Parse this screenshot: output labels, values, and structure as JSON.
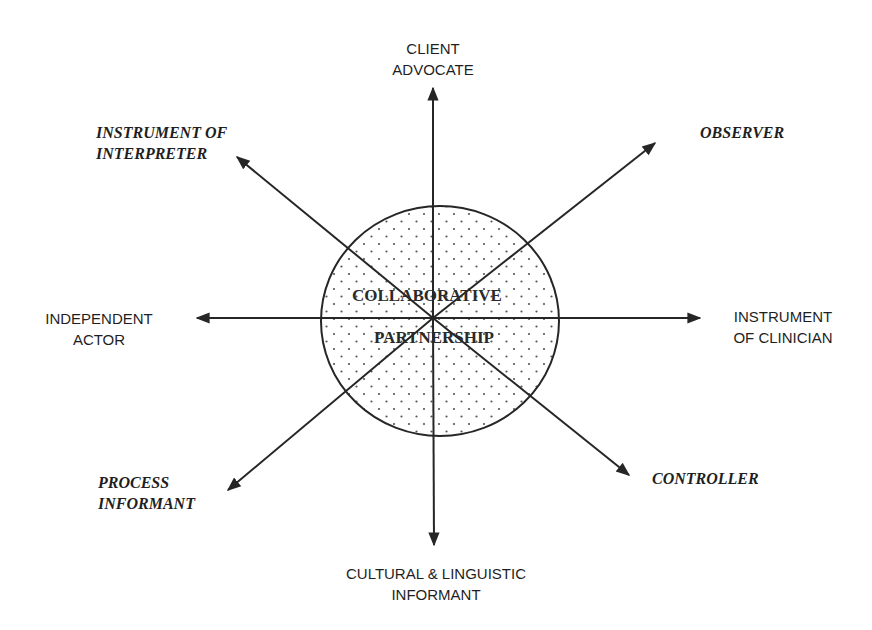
{
  "diagram": {
    "center": {
      "line1": "COLLABORATIVE",
      "line2": "PARTNERSHIP",
      "fill_pattern": "dotted"
    },
    "axes": [
      {
        "direction": "north",
        "line1": "CLIENT",
        "line2": "ADVOCATE",
        "style": "sans"
      },
      {
        "direction": "northeast",
        "line1": "OBSERVER",
        "line2": "",
        "style": "serif-italic-bold"
      },
      {
        "direction": "east",
        "line1": "INSTRUMENT",
        "line2": "OF CLINICIAN",
        "style": "sans"
      },
      {
        "direction": "southeast",
        "line1": "CONTROLLER",
        "line2": "",
        "style": "serif-italic-bold"
      },
      {
        "direction": "south",
        "line1": "CULTURAL & LINGUISTIC",
        "line2": "INFORMANT",
        "style": "sans"
      },
      {
        "direction": "southwest",
        "line1": "PROCESS",
        "line2": "INFORMANT",
        "style": "serif-italic-bold"
      },
      {
        "direction": "west",
        "line1": "INDEPENDENT",
        "line2": "ACTOR",
        "style": "sans"
      },
      {
        "direction": "northwest",
        "line1": "INSTRUMENT OF",
        "line2": "INTERPRETER",
        "style": "serif-italic-bold"
      }
    ],
    "colors": {
      "line": "#262626",
      "background": "#ffffff",
      "dots": "#555555"
    }
  }
}
